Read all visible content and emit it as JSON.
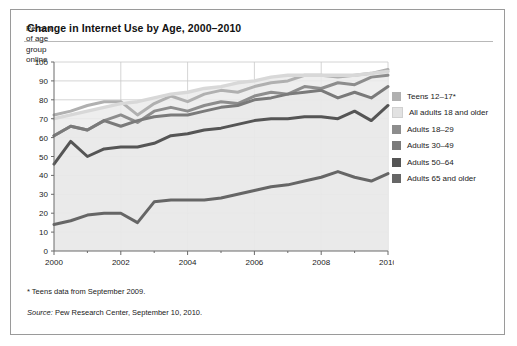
{
  "card": {
    "title": "Change in Internet Use by Age, 2000–2010",
    "footnote": "* Teens data from September 2009.",
    "source_word": "Source:",
    "source_rest": " Pew Research Center, September 10, 2010."
  },
  "legend": {
    "items": [
      {
        "label": "Teens 12–17*",
        "color": "#b0b0b0"
      },
      {
        "label": "All adults 18 and older",
        "color": "#e2e2e2"
      },
      {
        "label": "Adults 18–29",
        "color": "#8d8d8d"
      },
      {
        "label": "Adults 30–49",
        "color": "#7a7a7a"
      },
      {
        "label": "Adults 50–64",
        "color": "#555555"
      },
      {
        "label": "Adults 65 and older",
        "color": "#666666"
      }
    ]
  },
  "chart_data": {
    "type": "line",
    "title": "Change in Internet Use by Age, 2000–2010",
    "xlabel": "Year",
    "ylabel": "Percent of age group online",
    "ylabel_lines": [
      "Percent",
      "of age",
      "group",
      "online"
    ],
    "xlim": [
      2000,
      2010
    ],
    "ylim": [
      0,
      100
    ],
    "yticks": [
      0,
      10,
      20,
      30,
      40,
      50,
      60,
      70,
      80,
      90,
      100
    ],
    "xticks": [
      2000,
      2002,
      2004,
      2006,
      2008,
      2010
    ],
    "xtick_minor_step": 1,
    "grid": true,
    "legend_position": "right",
    "x": [
      2000,
      2000.5,
      2001,
      2001.5,
      2002,
      2002.5,
      2003,
      2003.5,
      2004,
      2004.5,
      2005,
      2005.5,
      2006,
      2006.5,
      2007,
      2007.5,
      2008,
      2008.5,
      2009,
      2009.5,
      2010
    ],
    "series": [
      {
        "name": "Teens 12–17*",
        "color": "#b0b0b0",
        "width": 3.0,
        "values": [
          72,
          74,
          77,
          79,
          79,
          72,
          78,
          82,
          79,
          83,
          85,
          84,
          87,
          89,
          90,
          93,
          93,
          92,
          93,
          94,
          96
        ]
      },
      {
        "name": "All adults 18 and older",
        "color": "#d8d8d8",
        "width": 3.4,
        "smooth": true,
        "area": true,
        "values": [
          70,
          72,
          74,
          76,
          78,
          79,
          81,
          83,
          84,
          86,
          87,
          89,
          90,
          92,
          93,
          93,
          93,
          93,
          93,
          94,
          95
        ]
      },
      {
        "name": "Adults 18–29",
        "color": "#8d8d8d",
        "width": 3.0,
        "values": [
          61,
          66,
          64,
          69,
          72,
          68,
          74,
          76,
          74,
          77,
          79,
          78,
          82,
          84,
          83,
          87,
          86,
          89,
          88,
          92,
          93
        ]
      },
      {
        "name": "Adults 30–49",
        "color": "#7a7a7a",
        "width": 3.0,
        "values": [
          61,
          66,
          64,
          69,
          66,
          69,
          71,
          72,
          72,
          74,
          76,
          77,
          80,
          81,
          83,
          84,
          85,
          81,
          84,
          81,
          87
        ]
      },
      {
        "name": "Adults 50–64",
        "color": "#555555",
        "width": 3.0,
        "values": [
          46,
          58,
          50,
          54,
          55,
          55,
          57,
          61,
          62,
          64,
          65,
          67,
          69,
          70,
          70,
          71,
          71,
          70,
          74,
          69,
          77
        ]
      },
      {
        "name": "Adults 65 and older",
        "color": "#666666",
        "width": 3.0,
        "values": [
          14,
          16,
          19,
          20,
          20,
          15,
          26,
          27,
          27,
          27,
          28,
          30,
          32,
          34,
          35,
          37,
          39,
          42,
          39,
          37,
          41
        ]
      }
    ]
  }
}
